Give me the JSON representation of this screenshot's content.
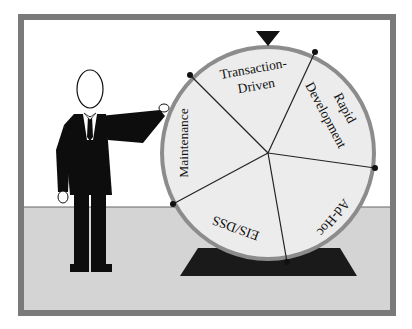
{
  "figure": {
    "colors": {
      "frame": "#7a7a7a",
      "wall": "#ffffff",
      "floor": "#d4d4d4",
      "wheel_face": "#ececec",
      "wheel_rim": "#8c8c8c",
      "stand": "#1a1a1a",
      "suit": "#0d0d0d"
    }
  },
  "wheel": {
    "pointer": "top-pointer-triangle",
    "segments": [
      {
        "label_line1": "Transaction-",
        "label_line2": "Driven"
      },
      {
        "label_line1": "Rapid",
        "label_line2": "Development"
      },
      {
        "label_line1": "Ad-Hoc",
        "label_line2": ""
      },
      {
        "label_line1": "EIS/DSS",
        "label_line2": ""
      },
      {
        "label_line1": "Maintenance",
        "label_line2": ""
      }
    ]
  }
}
